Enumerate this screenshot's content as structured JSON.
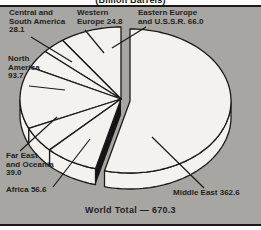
{
  "title": "(Billion Barrels)",
  "footer": {
    "text": "World Total — 670.3"
  },
  "chart_data": {
    "type": "pie",
    "style": "3d-exploded",
    "title": "(Billion Barrels)",
    "unit": "billion barrels",
    "total": 670.3,
    "total_label": "World Total — 670.3",
    "legend_position": "labels-around-pie",
    "colors": {
      "background": "#a8a6a3",
      "slice_fill": "#f3f2ef",
      "ink": "#1b1a18",
      "gap_wall": "#151515"
    },
    "slices": [
      {
        "label": "Eastern Europe and U.S.S.R.",
        "value": 66.0,
        "exploded": false,
        "display": [
          "Eastern Europe",
          "and U.S.S.R. 66.0"
        ]
      },
      {
        "label": "Western Europe",
        "value": 24.8,
        "exploded": false,
        "display": [
          "Western",
          "Europe 24.8"
        ]
      },
      {
        "label": "Central and South America",
        "value": 28.1,
        "exploded": false,
        "display": [
          "Central and",
          "South America",
          "28.1"
        ]
      },
      {
        "label": "North America",
        "value": 93.7,
        "exploded": false,
        "display": [
          "North",
          "America",
          "93.7"
        ]
      },
      {
        "label": "Far East and Oceania",
        "value": 39.0,
        "exploded": false,
        "display": [
          "Far East",
          "and Oceania",
          "39.0"
        ]
      },
      {
        "label": "Africa",
        "value": 56.6,
        "exploded": false,
        "display": [
          "Africa 56.6"
        ]
      },
      {
        "label": "Middle East",
        "value": 362.6,
        "exploded": true,
        "display": [
          "Middle East 362.6"
        ]
      }
    ]
  }
}
